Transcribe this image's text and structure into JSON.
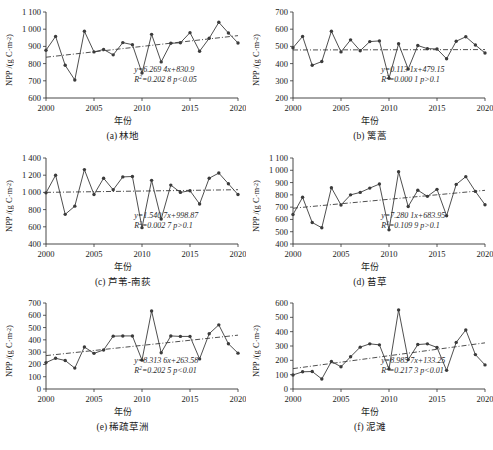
{
  "figure": {
    "years_label": "年份",
    "y_axis_label_prefix": "NPP /(g C·m",
    "y_axis_label_sup": "-2",
    "y_axis_label_suffix": ")",
    "bottom_caption": ""
  },
  "chart_data": [
    {
      "type": "line",
      "panel": "a",
      "caption": "(a) 林地",
      "title": "林地",
      "xlabel": "年份",
      "ylabel": "NPP /(g C·m-2)",
      "xlim": [
        2000,
        2020
      ],
      "ylim": [
        600,
        1100
      ],
      "yticks": [
        600,
        700,
        800,
        900,
        1000,
        1100
      ],
      "ytick_labels": [
        "600",
        "700",
        "800",
        "900",
        "1 000",
        "1 100"
      ],
      "xticks": [
        2000,
        2005,
        2010,
        2015,
        2020
      ],
      "xtick_labels": [
        "2000",
        "2005",
        "2010",
        "2015",
        "2020"
      ],
      "grid": false,
      "x": [
        2000,
        2001,
        2002,
        2003,
        2004,
        2005,
        2006,
        2007,
        2008,
        2009,
        2010,
        2011,
        2012,
        2013,
        2014,
        2015,
        2016,
        2017,
        2018,
        2019,
        2020
      ],
      "values": [
        878,
        958,
        790,
        705,
        988,
        868,
        882,
        851,
        922,
        910,
        745,
        970,
        810,
        918,
        921,
        980,
        872,
        947,
        1040,
        978,
        920
      ],
      "equation": "y=6.269 4x+830.9",
      "r2_text": "R2=0.202 8 p<0.05",
      "slope": 6.2694,
      "intercept": 830.9,
      "r_squared": 0.2028,
      "p_text": "p<0.05"
    },
    {
      "type": "line",
      "panel": "b",
      "caption": "(b) 篱蒿",
      "title": "篱蒿",
      "xlabel": "年份",
      "ylabel": "NPP /(g C·m-2)",
      "xlim": [
        2000,
        2020
      ],
      "ylim": [
        200,
        700
      ],
      "yticks": [
        200,
        300,
        400,
        500,
        600,
        700
      ],
      "ytick_labels": [
        "200",
        "300",
        "400",
        "500",
        "600",
        "700"
      ],
      "xticks": [
        2000,
        2005,
        2010,
        2015,
        2020
      ],
      "xtick_labels": [
        "2000",
        "2005",
        "2010",
        "2015",
        "2020"
      ],
      "grid": false,
      "x": [
        2000,
        2001,
        2002,
        2003,
        2004,
        2005,
        2006,
        2007,
        2008,
        2009,
        2010,
        2011,
        2012,
        2013,
        2014,
        2015,
        2016,
        2017,
        2018,
        2019,
        2020
      ],
      "values": [
        492,
        558,
        390,
        412,
        588,
        468,
        538,
        475,
        528,
        532,
        315,
        515,
        368,
        505,
        487,
        485,
        428,
        530,
        556,
        508,
        462
      ],
      "equation": "y=0.113 1x+479.15",
      "r2_text": "R2=0.000 1 p>0.1",
      "slope": 0.1131,
      "intercept": 479.15,
      "r_squared": 0.0001,
      "p_text": "p>0.1"
    },
    {
      "type": "line",
      "panel": "c",
      "caption": "(c) 芦苇-南荻",
      "title": "芦苇-南荻",
      "xlabel": "年份",
      "ylabel": "NPP /(g C·m-2)",
      "xlim": [
        2000,
        2020
      ],
      "ylim": [
        400,
        1400
      ],
      "yticks": [
        400,
        600,
        800,
        1000,
        1200,
        1400
      ],
      "ytick_labels": [
        "400",
        "600",
        "800",
        "1 000",
        "1 200",
        "1 400"
      ],
      "xticks": [
        2000,
        2005,
        2010,
        2015,
        2020
      ],
      "xtick_labels": [
        "2000",
        "2005",
        "2010",
        "2015",
        "2020"
      ],
      "grid": false,
      "x": [
        2000,
        2001,
        2002,
        2003,
        2004,
        2005,
        2006,
        2007,
        2008,
        2009,
        2010,
        2011,
        2012,
        2013,
        2014,
        2015,
        2016,
        2017,
        2018,
        2019,
        2020
      ],
      "values": [
        995,
        1200,
        745,
        840,
        1265,
        975,
        1165,
        1030,
        1180,
        1185,
        590,
        1140,
        690,
        1085,
        1000,
        1020,
        865,
        1165,
        1225,
        1100,
        975
      ],
      "equation": "y=1.540 7x+998.87",
      "r2_text": "R2=0.002 7 p>0.1",
      "slope": 1.5407,
      "intercept": 998.87,
      "r_squared": 0.0027,
      "p_text": "p>0.1"
    },
    {
      "type": "line",
      "panel": "d",
      "caption": "(d) 苔草",
      "title": "苔草",
      "xlabel": "年份",
      "ylabel": "NPP /(g C·m-2)",
      "xlim": [
        2000,
        2020
      ],
      "ylim": [
        400,
        1100
      ],
      "yticks": [
        400,
        500,
        600,
        700,
        800,
        900,
        1000,
        1100
      ],
      "ytick_labels": [
        "400",
        "500",
        "600",
        "700",
        "800",
        "900",
        "1 000",
        "1 100"
      ],
      "xticks": [
        2000,
        2005,
        2010,
        2015,
        2020
      ],
      "xtick_labels": [
        "2000",
        "2005",
        "2010",
        "2015",
        "2020"
      ],
      "grid": false,
      "x": [
        2000,
        2001,
        2002,
        2003,
        2004,
        2005,
        2006,
        2007,
        2008,
        2009,
        2010,
        2011,
        2012,
        2013,
        2014,
        2015,
        2016,
        2017,
        2018,
        2019,
        2020
      ],
      "values": [
        640,
        780,
        575,
        532,
        858,
        718,
        800,
        820,
        855,
        888,
        515,
        988,
        705,
        838,
        788,
        845,
        630,
        885,
        948,
        828,
        720
      ],
      "equation": "y=7.280 1x+683.95",
      "r2_text": "R2=0.109 9 p>0.1",
      "slope": 7.2801,
      "intercept": 683.95,
      "r_squared": 0.1099,
      "p_text": "p>0.1"
    },
    {
      "type": "line",
      "panel": "e",
      "caption": "(e) 稀疏草洲",
      "title": "稀疏草洲",
      "xlabel": "年份",
      "ylabel": "NPP /(g C·m-2)",
      "xlim": [
        2000,
        2020
      ],
      "ylim": [
        0,
        700
      ],
      "yticks": [
        0,
        100,
        200,
        300,
        400,
        500,
        600,
        700
      ],
      "ytick_labels": [
        "0",
        "100",
        "200",
        "300",
        "400",
        "500",
        "600",
        "700"
      ],
      "xticks": [
        2000,
        2005,
        2010,
        2015,
        2020
      ],
      "xtick_labels": [
        "2000",
        "2005",
        "2010",
        "2015",
        "2020"
      ],
      "grid": false,
      "x": [
        2000,
        2001,
        2002,
        2003,
        2004,
        2005,
        2006,
        2007,
        2008,
        2009,
        2010,
        2011,
        2012,
        2013,
        2014,
        2015,
        2016,
        2017,
        2018,
        2019,
        2020
      ],
      "values": [
        215,
        250,
        232,
        170,
        342,
        290,
        318,
        430,
        432,
        432,
        235,
        635,
        295,
        432,
        428,
        428,
        245,
        450,
        522,
        368,
        292
      ],
      "equation": "y=8.313 6x+263.58",
      "r2_text": "R2=0.202 5 p<0.01",
      "slope": 8.3136,
      "intercept": 263.58,
      "r_squared": 0.2025,
      "p_text": "p<0.01"
    },
    {
      "type": "line",
      "panel": "f",
      "caption": "(f) 泥滩",
      "title": "泥滩",
      "xlabel": "年份",
      "ylabel": "NPP /(g C·m-2)",
      "xlim": [
        2000,
        2020
      ],
      "ylim": [
        0,
        600
      ],
      "yticks": [
        0,
        100,
        200,
        300,
        400,
        500,
        600
      ],
      "ytick_labels": [
        "0",
        "100",
        "200",
        "300",
        "400",
        "500",
        "600"
      ],
      "xticks": [
        2000,
        2005,
        2010,
        2015,
        2020
      ],
      "xtick_labels": [
        "2000",
        "2005",
        "2010",
        "2015",
        "2020"
      ],
      "grid": false,
      "x": [
        2000,
        2001,
        2002,
        2003,
        2004,
        2005,
        2006,
        2007,
        2008,
        2009,
        2010,
        2011,
        2012,
        2013,
        2014,
        2015,
        2016,
        2017,
        2018,
        2019,
        2020
      ],
      "values": [
        98,
        120,
        122,
        70,
        192,
        155,
        225,
        292,
        315,
        308,
        140,
        552,
        205,
        310,
        315,
        290,
        130,
        325,
        412,
        240,
        168
      ],
      "equation": "y=8.985 7x+133.25",
      "r2_text": "R2=0.217 3 p<0.01",
      "slope": 8.9857,
      "intercept": 133.25,
      "r_squared": 0.2173,
      "p_text": "p<0.01"
    }
  ]
}
